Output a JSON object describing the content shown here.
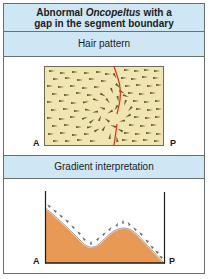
{
  "figure": {
    "title_line1_pre": "Abnormal ",
    "title_line1_italic": "Oncopeltus",
    "title_line1_post": " with a",
    "title_line2": "gap in the segment boundary",
    "sections": [
      {
        "heading": "Hair pattern",
        "axis_left": "A",
        "axis_right": "P"
      },
      {
        "heading": "Gradient interpretation",
        "axis_left": "A",
        "axis_right": "P"
      }
    ]
  },
  "colors": {
    "header_bg": "#cfe6f4",
    "hair_field": "#f1e6b2",
    "hair": "#5e5a33",
    "boundary": "#d93a1e",
    "gradient_fill": "#e89a55",
    "border": "#6a6f72"
  }
}
